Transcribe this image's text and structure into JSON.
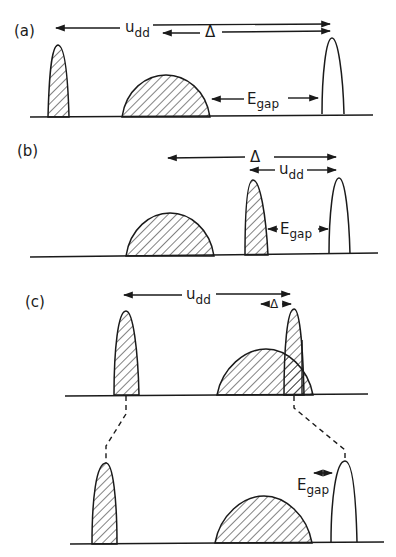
{
  "figure": {
    "type": "energy-level density-of-states schematic",
    "colors": {
      "ink": "#1a1a1a",
      "background": "#ffffff"
    },
    "panels": [
      {
        "id": "a",
        "label": "(a)",
        "arrows": [
          {
            "name": "u_dd",
            "symbol": "u",
            "subscript": "dd",
            "direction": "double"
          },
          {
            "name": "Delta",
            "symbol": "Δ",
            "subscript": "",
            "direction": "double"
          },
          {
            "name": "E_gap",
            "symbol": "E",
            "subscript": "gap",
            "direction": "double"
          }
        ],
        "bands": [
          "hatched-narrow-peak",
          "hatched-broad-band",
          "open-narrow-peak"
        ]
      },
      {
        "id": "b",
        "label": "(b)",
        "arrows": [
          {
            "name": "Delta",
            "symbol": "Δ",
            "subscript": "",
            "direction": "double"
          },
          {
            "name": "u_dd",
            "symbol": "u",
            "subscript": "dd",
            "direction": "double"
          },
          {
            "name": "E_gap",
            "symbol": "E",
            "subscript": "gap",
            "direction": "double"
          }
        ],
        "bands": [
          "hatched-broad-band",
          "hatched-narrow-peak",
          "open-narrow-peak"
        ]
      },
      {
        "id": "c",
        "label": "(c)",
        "arrows": [
          {
            "name": "u_dd",
            "symbol": "u",
            "subscript": "dd",
            "direction": "double"
          },
          {
            "name": "Delta",
            "symbol": "Δ",
            "subscript": "",
            "direction": "double"
          },
          {
            "name": "E_gap",
            "symbol": "E",
            "subscript": "gap",
            "direction": "double"
          }
        ],
        "bands_top": [
          "hatched-narrow-peak",
          "hatched-broad-band",
          "hatched-narrow-peak"
        ],
        "bands_bottom": [
          "hatched-narrow-peak",
          "hatched-broad-band",
          "open-narrow-peak"
        ],
        "connectors": "dashed lines mapping top peaks to bottom peaks"
      }
    ]
  },
  "labels": {
    "a": "(a)",
    "b": "(b)",
    "c": "(c)",
    "u": "u",
    "dd": "dd",
    "delta": "Δ",
    "E": "E",
    "gap": "gap"
  }
}
